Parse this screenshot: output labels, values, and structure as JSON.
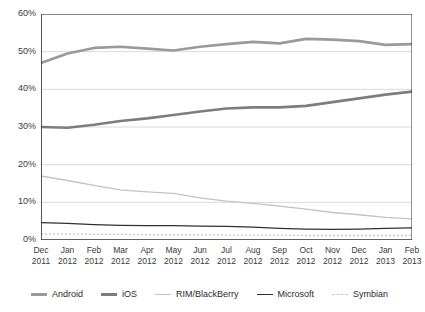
{
  "title": "",
  "chart_data": {
    "type": "line",
    "title": "",
    "subtitle": "",
    "xlabel": "",
    "ylabel": "",
    "ylim": [
      0,
      60
    ],
    "ytick_labels": [
      "0%",
      "10%",
      "20%",
      "30%",
      "40%",
      "50%",
      "60%"
    ],
    "ytick_values": [
      0,
      10,
      20,
      30,
      40,
      50,
      60
    ],
    "grid": true,
    "grid_axis": "y",
    "legend_position": "bottom",
    "categories": [
      "Dec 2011",
      "Jan 2012",
      "Feb 2012",
      "Mar 2012",
      "Apr 2012",
      "May 2012",
      "Jun 2012",
      "Jul 2012",
      "Aug 2012",
      "Sep 2012",
      "Oct 2012",
      "Nov 2012",
      "Dec 2012",
      "Jan 2013",
      "Feb 2013"
    ],
    "categories_month": [
      "Dec",
      "Jan",
      "Feb",
      "Mar",
      "Apr",
      "May",
      "Jun",
      "Jul",
      "Aug",
      "Sep",
      "Oct",
      "Nov",
      "Dec",
      "Jan",
      "Feb"
    ],
    "categories_year": [
      "2011",
      "2012",
      "2012",
      "2012",
      "2012",
      "2012",
      "2012",
      "2012",
      "2012",
      "2012",
      "2012",
      "2012",
      "2012",
      "2013",
      "2013"
    ],
    "series": [
      {
        "name": "Android",
        "color": "#9a9a9a",
        "width": 2.6,
        "dash": "none",
        "values": [
          47.0,
          49.5,
          51.0,
          51.3,
          50.8,
          50.3,
          51.3,
          52.0,
          52.6,
          52.2,
          53.4,
          53.2,
          52.8,
          51.8,
          52.0
        ]
      },
      {
        "name": "iOS",
        "color": "#7d7d7d",
        "width": 2.6,
        "dash": "none",
        "values": [
          30.0,
          29.8,
          30.6,
          31.6,
          32.3,
          33.2,
          34.1,
          34.9,
          35.2,
          35.2,
          35.6,
          36.6,
          37.6,
          38.6,
          39.4
        ]
      },
      {
        "name": "RIM/BlackBerry",
        "color": "#c2c2c2",
        "width": 1.3,
        "dash": "none",
        "values": [
          17.0,
          15.8,
          14.5,
          13.3,
          12.8,
          12.4,
          11.2,
          10.3,
          9.7,
          9.0,
          8.2,
          7.3,
          6.7,
          6.0,
          5.6
        ]
      },
      {
        "name": "Microsoft",
        "color": "#303030",
        "width": 1.3,
        "dash": "none",
        "values": [
          4.6,
          4.4,
          4.1,
          3.9,
          3.8,
          3.8,
          3.7,
          3.6,
          3.4,
          3.1,
          2.9,
          2.8,
          2.9,
          3.1,
          3.2
        ]
      },
      {
        "name": "Symbian",
        "color": "#c8c8c8",
        "width": 1.3,
        "dash": "2,2",
        "values": [
          1.6,
          1.6,
          1.5,
          1.5,
          1.4,
          1.4,
          1.4,
          1.3,
          1.3,
          1.3,
          1.2,
          1.2,
          1.2,
          1.2,
          1.2
        ]
      }
    ]
  },
  "legend": {
    "items": [
      {
        "label": "Android",
        "color": "#9a9a9a",
        "width": 3,
        "dash": "none"
      },
      {
        "label": "iOS",
        "color": "#7d7d7d",
        "width": 3,
        "dash": "none"
      },
      {
        "label": "RIM/BlackBerry",
        "color": "#c2c2c2",
        "width": 1.5,
        "dash": "none"
      },
      {
        "label": "Microsoft",
        "color": "#303030",
        "width": 1.5,
        "dash": "none"
      },
      {
        "label": "Symbian",
        "color": "#c8c8c8",
        "width": 1.5,
        "dash": "2,2"
      }
    ]
  }
}
